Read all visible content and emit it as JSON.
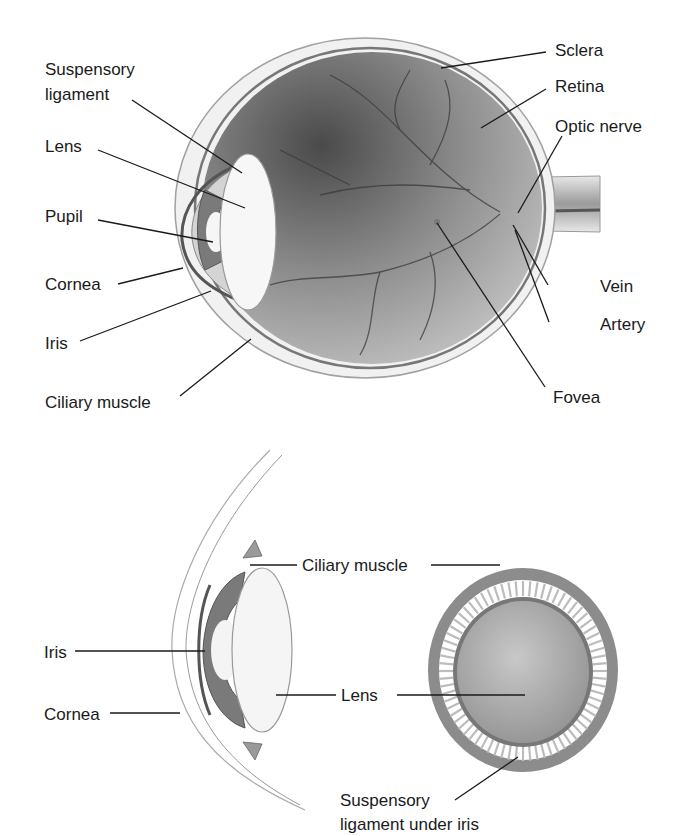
{
  "top_diagram": {
    "labels": {
      "suspensory_ligament_1": "Suspensory",
      "suspensory_ligament_2": "ligament",
      "lens": "Lens",
      "pupil": "Pupil",
      "cornea": "Cornea",
      "iris": "Iris",
      "ciliary_muscle": "Ciliary muscle",
      "sclera": "Sclera",
      "retina": "Retina",
      "optic_nerve": "Optic nerve",
      "vein": "Vein",
      "artery": "Artery",
      "fovea": "Fovea"
    }
  },
  "bottom_diagram": {
    "labels": {
      "ciliary_muscle": "Ciliary muscle",
      "iris": "Iris",
      "cornea": "Cornea",
      "lens": "Lens",
      "suspensory_1": "Suspensory",
      "suspensory_2": "ligament under iris"
    }
  },
  "colors": {
    "eyeball_dark": "#5a5a5a",
    "eyeball_light": "#bdbdbd",
    "ring": "#8c8c8c",
    "lens_fill": "#a8a8a8"
  }
}
